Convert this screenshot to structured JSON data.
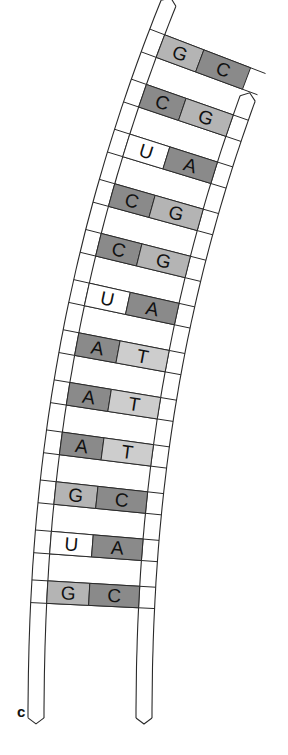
{
  "figure": {
    "panel_label": "c",
    "colors": {
      "outline": "#2a2a2a",
      "dark_base": "#8a8a8a",
      "light_base": "#b4b4b4",
      "pale_base": "#cdcdcd",
      "rna_u": "#ffffff",
      "background": "#ffffff"
    },
    "strands": {
      "left": {
        "type": "RNA"
      },
      "right": {
        "type": "DNA"
      }
    },
    "base_pairs": [
      {
        "left": "G",
        "right": "C",
        "left_shade": "light",
        "right_shade": "dark"
      },
      {
        "left": "C",
        "right": "G",
        "left_shade": "dark",
        "right_shade": "light"
      },
      {
        "left": "U",
        "right": "A",
        "left_shade": "white",
        "right_shade": "dark"
      },
      {
        "left": "C",
        "right": "G",
        "left_shade": "dark",
        "right_shade": "light"
      },
      {
        "left": "C",
        "right": "G",
        "left_shade": "dark",
        "right_shade": "light"
      },
      {
        "left": "U",
        "right": "A",
        "left_shade": "white",
        "right_shade": "dark"
      },
      {
        "left": "A",
        "right": "T",
        "left_shade": "dark",
        "right_shade": "pale"
      },
      {
        "left": "A",
        "right": "T",
        "left_shade": "dark",
        "right_shade": "pale"
      },
      {
        "left": "A",
        "right": "T",
        "left_shade": "dark",
        "right_shade": "pale"
      },
      {
        "left": "G",
        "right": "C",
        "left_shade": "light",
        "right_shade": "dark"
      },
      {
        "left": "U",
        "right": "A",
        "left_shade": "white",
        "right_shade": "dark"
      },
      {
        "left": "G",
        "right": "C",
        "left_shade": "light",
        "right_shade": "dark"
      }
    ]
  }
}
